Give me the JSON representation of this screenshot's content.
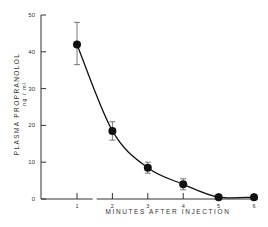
{
  "chart_data": {
    "type": "line",
    "title": "",
    "xlabel": "MINUTES AFTER INJECTION",
    "ylabel": "PLASMA PROPRANOLOL",
    "ylabel_units": "ng / ml",
    "x": [
      1,
      2,
      3,
      4,
      5,
      6
    ],
    "series": [
      {
        "name": "Plasma propranolol",
        "values": [
          42,
          18.5,
          8.5,
          4,
          0.5,
          0.5
        ],
        "error_low": [
          36.5,
          16,
          7,
          2.5,
          0.5,
          0.5
        ],
        "error_high": [
          48,
          21,
          10,
          5.5,
          0.5,
          0.5
        ],
        "marker": "filled-circle",
        "line": "smooth-curve"
      }
    ],
    "xticks": [
      "1",
      "2",
      "3",
      "4",
      "5",
      "6"
    ],
    "yticks": [
      "0",
      "10",
      "20",
      "30",
      "40",
      "50"
    ],
    "xlim": [
      0,
      6
    ],
    "ylim": [
      0,
      50
    ],
    "grid": false,
    "legend": null,
    "colors": {
      "ink": "#111111",
      "axis": "#333333"
    }
  }
}
